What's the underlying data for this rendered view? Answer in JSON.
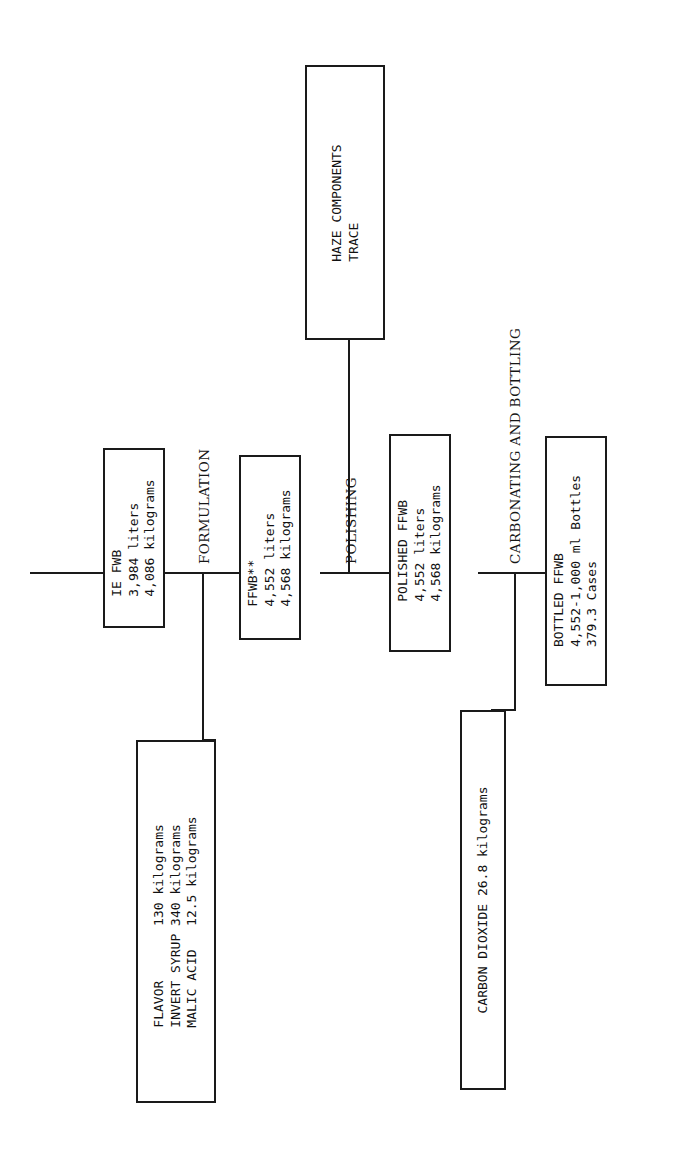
{
  "diagram": {
    "type": "process-flow",
    "orientation": "rotated-90-counterclockwise",
    "stages": [
      {
        "id": "formulation",
        "label": "FORMULATION"
      },
      {
        "id": "polishing",
        "label": "POLISHING"
      },
      {
        "id": "carbonating",
        "label": "CARBONATING AND BOTTLING"
      }
    ],
    "boxes": [
      {
        "id": "ie-fwb",
        "lines": [
          "IE FWB",
          "3,984 liters",
          "4,086 kilograms"
        ]
      },
      {
        "id": "ffwb",
        "lines": [
          "FFWB**",
          "4,552 liters",
          "4,568 kilograms"
        ]
      },
      {
        "id": "haze-components",
        "lines": [
          "HAZE COMPONENTS",
          "TRACE"
        ]
      },
      {
        "id": "polished-ffwb",
        "lines": [
          "POLISHED FFWB",
          "4,552 liters",
          "4,568 kilograms"
        ]
      },
      {
        "id": "bottled-ffwb",
        "lines": [
          "BOTTLED FFWB",
          "4,552-1,000 ml Bottles",
          "379.3 Cases"
        ]
      },
      {
        "id": "ingredients",
        "lines": [
          "FLAVOR       130 kilograms",
          "INVERT SYRUP 340 kilograms",
          "MALIC ACID   12.5 kilograms"
        ]
      },
      {
        "id": "carbon-dioxide",
        "lines": [
          "CARBON DIOXIDE 26.8 kilograms"
        ]
      }
    ],
    "colors": {
      "ink": "#1a1a1a",
      "paper": "#ffffff"
    }
  }
}
